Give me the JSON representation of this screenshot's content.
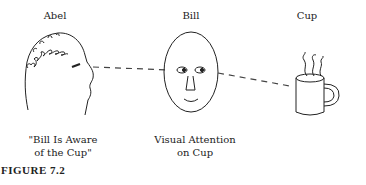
{
  "figure": {
    "labels": {
      "abel": "Abel",
      "bill": "Bill",
      "cup": "Cup"
    },
    "captions": {
      "abel_line1": "\"Bill Is Aware",
      "abel_line2": "of the Cup\"",
      "bill_line1": "Visual Attention",
      "bill_line2": "on Cup"
    },
    "figure_label": "FIGURE 7.2",
    "icons": [
      "abel-head-profile-icon",
      "bill-face-icon",
      "coffee-cup-icon"
    ],
    "colors": {
      "line": "#222222",
      "background": "#ffffff"
    }
  }
}
